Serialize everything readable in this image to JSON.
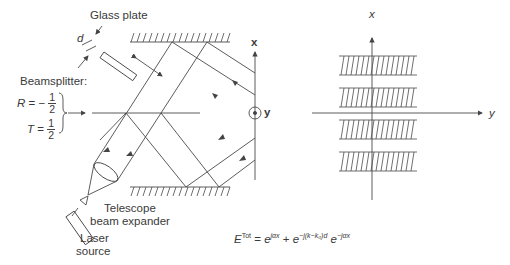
{
  "labels": {
    "glass_plate": "Glass plate",
    "d": "d",
    "beamsplitter": "Beamsplitter:",
    "R_label": "R",
    "R_sign": "= −",
    "T_label": "T",
    "T_sign": "=",
    "frac_num": "1",
    "frac_den": "2",
    "telescope_line1": "Telescope",
    "telescope_line2": "beam expander",
    "laser_line1": "Laser",
    "laser_line2": "source",
    "axis_x_left": "x",
    "axis_y_left": "y",
    "axis_x_right": "x",
    "axis_y_right": "y"
  },
  "formula": {
    "E": "E",
    "E_sup": "Tot",
    "eq": " = ",
    "term1_base": "e",
    "term1_sup": "jαx",
    "plus": " + ",
    "term2_base": "e",
    "term2_sup": "−j(k−k₀)d",
    "term3_base": " e",
    "term3_sup": "−jαx"
  },
  "colors": {
    "line": "#4a4a4a",
    "text": "#3a3a3a",
    "background": "#ffffff"
  }
}
